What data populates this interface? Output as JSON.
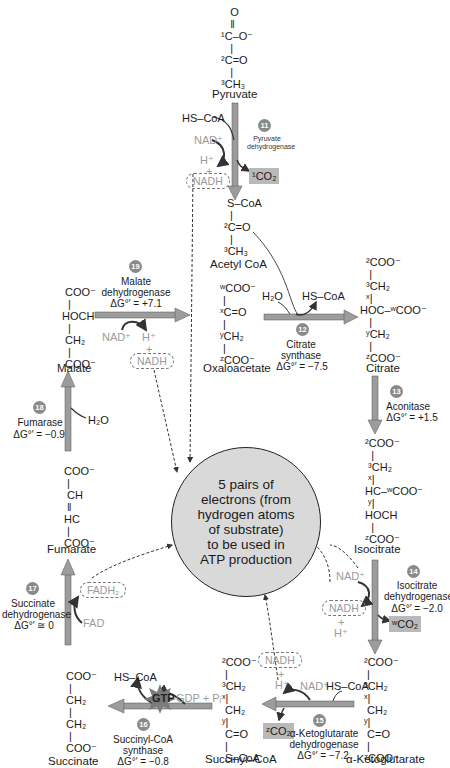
{
  "diagram": {
    "center": {
      "text": "5 pairs of\nelectrons (from\nhydrogen atoms\nof substrate)\nto be used in\nATP production",
      "fill": "#d9d9d9"
    },
    "colors": {
      "arrow": "#8c8c8c",
      "co2_box": "#b9b9b9",
      "badge": "#8a8a8a",
      "cofactor_text": "#9a9a9a"
    },
    "molecules": {
      "pyruvate": {
        "name": "Pyruvate",
        "lines": [
          "O",
          "‖",
          "¹C–O⁻",
          "|",
          "²C=O",
          "|",
          "³CH₃"
        ]
      },
      "acetyl_coa": {
        "name": "Acetyl CoA",
        "lines": [
          "S–CoA",
          "|",
          "²C=O",
          "|",
          "³CH₃"
        ]
      },
      "oxaloacetate": {
        "name": "Oxaloacetate",
        "lines": [
          "ʷCOO⁻",
          "|",
          "ˣC=O",
          "|",
          "ʸCH₂",
          "|",
          "ᶻCOO⁻"
        ]
      },
      "citrate": {
        "name": "Citrate",
        "lines": [
          "²COO⁻",
          "|",
          "³CH₂",
          "ˣ|",
          "HOC–ʷCOO⁻",
          "|",
          "ʸCH₂",
          "|",
          "ᶻCOO⁻"
        ]
      },
      "isocitrate": {
        "name": "Isocitrate",
        "lines": [
          "²COO⁻",
          "|",
          "³CH₂",
          "ˣ|",
          "HC–ʷCOO⁻",
          "ʸ|",
          "HOCH",
          "|",
          "ᶻCOO⁻"
        ]
      },
      "alpha_ketoglutarate": {
        "name": "α-Ketoglutarate",
        "lines": [
          "²COO⁻",
          "|",
          "³CH₂",
          "ˣ|",
          "CH₂",
          "ʸ|",
          "C=O",
          "|",
          "ᶻCOO⁻"
        ]
      },
      "succinyl_coa": {
        "name": "Succinyl–CoA",
        "lines": [
          "²COO⁻",
          "|",
          "³CH₂",
          "ˣ|",
          "CH₂",
          "ʸ|",
          "C=O",
          "|",
          "S–CoA"
        ]
      },
      "succinate": {
        "name": "Succinate",
        "lines": [
          "COO⁻",
          "|",
          "CH₂",
          "|",
          "CH₂",
          "|",
          "COO⁻"
        ]
      },
      "fumarate": {
        "name": "Fumarate",
        "lines": [
          "COO⁻",
          "|",
          "CH",
          "‖",
          "HC",
          "|",
          "COO⁻"
        ]
      },
      "malate": {
        "name": "Malate",
        "lines": [
          "COO⁻",
          "|",
          "HOCH",
          "|",
          "CH₂",
          "|",
          "COO⁻"
        ]
      }
    },
    "steps": [
      {
        "number": "11",
        "enzyme": "Pyruvate\ndehydrogenase",
        "dg": "",
        "inputs": [
          "HS–CoA",
          "NAD⁺"
        ],
        "outputs": [
          "H⁺",
          "+",
          "NADH",
          "¹CO₂"
        ]
      },
      {
        "number": "12",
        "enzyme": "Citrate\nsynthase",
        "dg": "ΔG°′ = −7.5",
        "inputs": [
          "H₂O"
        ],
        "outputs": [
          "HS–CoA"
        ]
      },
      {
        "number": "13",
        "enzyme": "Aconitase",
        "dg": "ΔG°′ = +1.5",
        "inputs": [],
        "outputs": []
      },
      {
        "number": "14",
        "enzyme": "Isocitrate\ndehydrogenase",
        "dg": "ΔG°′ = −2.0",
        "inputs": [
          "NAD⁺"
        ],
        "outputs": [
          "NADH",
          "+",
          "H⁺",
          "ʷCO₂"
        ]
      },
      {
        "number": "15",
        "enzyme": "α-Ketoglutarate\ndehydrogenase",
        "dg": "ΔG°′ = −7.2",
        "inputs": [
          "NAD⁺",
          "HS–CoA"
        ],
        "outputs": [
          "NADH",
          "+",
          "H⁺",
          "ᶻCO₂"
        ]
      },
      {
        "number": "16",
        "enzyme": "Succinyl-CoA\nsynthase",
        "dg": "ΔG°′ = −0.8",
        "inputs": [
          "GDP + Pᵢ"
        ],
        "outputs": [
          "GTP",
          "HS–CoA"
        ]
      },
      {
        "number": "17",
        "enzyme": "Succinate\ndehydrogenase",
        "dg": "ΔG°′ ≅ 0",
        "inputs": [
          "FAD"
        ],
        "outputs": [
          "FADH₂"
        ]
      },
      {
        "number": "18",
        "enzyme": "Fumarase",
        "dg": "ΔG°′ = −0.9",
        "inputs": [
          "H₂O"
        ],
        "outputs": []
      },
      {
        "number": "19",
        "enzyme": "Malate\ndehydrogenase",
        "dg": "ΔG°′ = +7.1",
        "inputs": [
          "NAD⁺"
        ],
        "outputs": [
          "H⁺",
          "+",
          "NADH"
        ]
      }
    ]
  }
}
